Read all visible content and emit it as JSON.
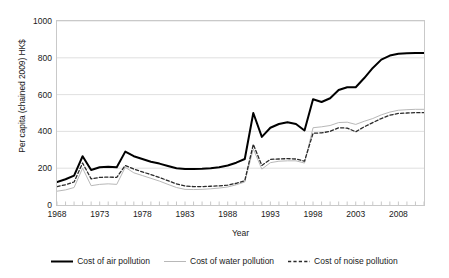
{
  "chart_data": {
    "type": "line",
    "title": "",
    "xlabel": "Year",
    "ylabel": "Per capita (chained 2009) HK$",
    "xlim": [
      1968,
      2011
    ],
    "ylim": [
      0,
      1000
    ],
    "ytick_labels": [
      "0",
      "200",
      "400",
      "600",
      "800",
      "1000"
    ],
    "ytick_values": [
      0,
      200,
      400,
      600,
      800,
      1000
    ],
    "xtick_labels": [
      "1968",
      "1973",
      "1978",
      "1983",
      "1988",
      "1993",
      "1998",
      "2003",
      "2008"
    ],
    "xtick_values": [
      1968,
      1973,
      1978,
      1983,
      1988,
      1993,
      1998,
      2003,
      2008
    ],
    "grid": "horizontal",
    "legend_position": "bottom",
    "x": [
      1968,
      1969,
      1970,
      1971,
      1972,
      1973,
      1974,
      1975,
      1976,
      1977,
      1978,
      1979,
      1980,
      1981,
      1982,
      1983,
      1984,
      1985,
      1986,
      1987,
      1988,
      1989,
      1990,
      1991,
      1992,
      1993,
      1994,
      1995,
      1996,
      1997,
      1998,
      1999,
      2000,
      2001,
      2002,
      2003,
      2004,
      2005,
      2006,
      2007,
      2008,
      2009,
      2010,
      2011
    ],
    "series": [
      {
        "name": "Cost of air pollution",
        "color": "#000000",
        "style": "solid",
        "width": 2.0,
        "values": [
          125,
          140,
          160,
          265,
          190,
          205,
          208,
          205,
          290,
          265,
          250,
          235,
          225,
          212,
          200,
          196,
          196,
          197,
          200,
          205,
          215,
          230,
          250,
          500,
          370,
          420,
          440,
          450,
          440,
          405,
          575,
          560,
          580,
          625,
          640,
          640,
          690,
          745,
          790,
          812,
          822,
          825,
          826,
          826
        ]
      },
      {
        "name": "Cost of water pollution",
        "color": "#b8b8b8",
        "style": "solid",
        "width": 1.0,
        "values": [
          75,
          82,
          95,
          200,
          105,
          112,
          115,
          112,
          205,
          175,
          160,
          145,
          130,
          112,
          95,
          85,
          84,
          85,
          88,
          92,
          98,
          110,
          125,
          305,
          195,
          230,
          238,
          240,
          240,
          228,
          420,
          425,
          432,
          448,
          450,
          438,
          455,
          470,
          490,
          505,
          515,
          518,
          520,
          520
        ]
      },
      {
        "name": "Cost of noise pollution",
        "color": "#2a2a2a",
        "style": "dashed",
        "width": 1.3,
        "values": [
          100,
          110,
          125,
          228,
          142,
          150,
          152,
          150,
          215,
          195,
          180,
          165,
          150,
          132,
          115,
          103,
          100,
          100,
          102,
          104,
          108,
          118,
          132,
          330,
          215,
          248,
          250,
          252,
          250,
          238,
          390,
          392,
          400,
          420,
          418,
          398,
          425,
          448,
          470,
          488,
          498,
          500,
          502,
          502
        ]
      }
    ]
  },
  "legend": {
    "items": [
      {
        "label": "Cost of air pollution"
      },
      {
        "label": "Cost of water pollution"
      },
      {
        "label": "Cost of noise pollution"
      }
    ]
  }
}
